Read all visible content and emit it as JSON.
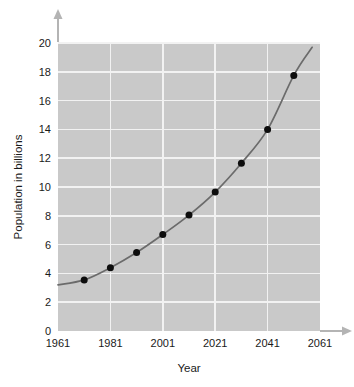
{
  "chart_data": {
    "type": "line",
    "title": "",
    "subtitle": "",
    "xlabel": "Year",
    "ylabel": "Population in billions",
    "x": [
      1971,
      1981,
      1991,
      2001,
      2011,
      2021,
      2031,
      2041,
      2051
    ],
    "values": [
      3.55,
      4.4,
      5.45,
      6.7,
      8.05,
      9.65,
      11.65,
      14.0,
      17.75
    ],
    "series": [
      {
        "name": "World population",
        "values": [
          3.55,
          4.4,
          5.45,
          6.7,
          8.05,
          9.65,
          11.65,
          14.0,
          17.75
        ]
      }
    ],
    "xlim": [
      1961,
      2061
    ],
    "ylim": [
      0,
      20.5
    ],
    "xticks": [
      1961,
      1981,
      2001,
      2021,
      2041,
      2061
    ],
    "xtick_labels": [
      "1961",
      "1981",
      "2001",
      "2021",
      "2041",
      "2061"
    ],
    "yticks": [
      0,
      2,
      4,
      6,
      8,
      10,
      12,
      14,
      16,
      18,
      20
    ],
    "ytick_labels": [
      "0",
      "2",
      "4",
      "6",
      "8",
      "10",
      "12",
      "14",
      "16",
      "18",
      "20"
    ],
    "grid": true,
    "legend": false,
    "legend_position": "none",
    "curve_start": {
      "x": 1961,
      "y": 3.2
    },
    "curve_end": {
      "x": 2058,
      "y": 19.7
    },
    "colors": {
      "plot_background": "#c9c9c9",
      "gridline": "#f2f2f2",
      "curve": "#6b6b6b",
      "marker": "#0d0d0d",
      "axis_arrow": "#b4b4b4",
      "text": "#1a1a1a",
      "page_background": "#ffffff"
    }
  }
}
